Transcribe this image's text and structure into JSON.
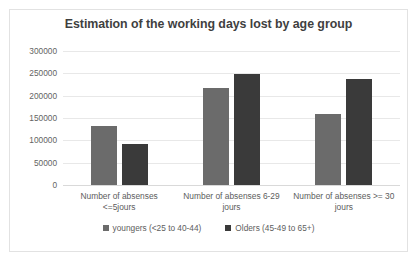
{
  "chart_data": {
    "type": "bar",
    "title": "Estimation of the working days lost by age group",
    "xlabel": "",
    "ylabel": "",
    "ylim": [
      0,
      300000
    ],
    "yticks": [
      300000,
      250000,
      200000,
      150000,
      100000,
      50000,
      0
    ],
    "ytick_labels": [
      "300000",
      "250000",
      "200000",
      "150000",
      "100000",
      "50000",
      "0"
    ],
    "grid": true,
    "legend_position": "bottom",
    "categories": [
      "Number of absenses <=5jours",
      "Number of absenses 6-29 jours",
      "Number of absenses >= 30 jours"
    ],
    "series": [
      {
        "name": "youngers (<25 to 40-44)",
        "color": "#6b6b6b",
        "values": [
          132000,
          217000,
          159000
        ]
      },
      {
        "name": "Olders (45-49 to 65+)",
        "color": "#3a3a3a",
        "values": [
          92000,
          249000,
          237000
        ]
      }
    ]
  },
  "colors": {
    "series_younger": "#6b6b6b",
    "series_older": "#3a3a3a",
    "title_text": "#3f3f3f",
    "axis_text": "#636363",
    "gridline": "#e8e8e8",
    "card_border": "#e2e2e2",
    "background": "#ffffff"
  }
}
